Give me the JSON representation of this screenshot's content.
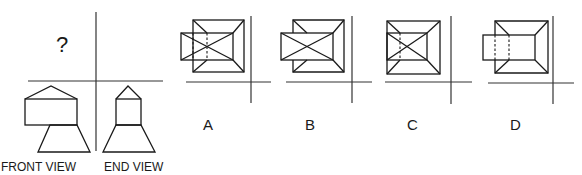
{
  "question": {
    "unknown_view_symbol": "?",
    "views": [
      {
        "id": "front",
        "label": "FRONT VIEW"
      },
      {
        "id": "end",
        "label": "END VIEW"
      }
    ]
  },
  "options": [
    {
      "id": "A",
      "label": "A"
    },
    {
      "id": "B",
      "label": "B"
    },
    {
      "id": "C",
      "label": "C"
    },
    {
      "id": "D",
      "label": "D"
    }
  ],
  "colors": {
    "line": "#1a1a1a",
    "background": "#ffffff"
  }
}
